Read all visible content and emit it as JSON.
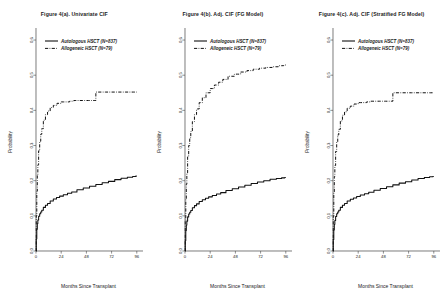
{
  "figure": {
    "background": "#ffffff",
    "axis_color": "#444444",
    "curve_color": "#111111"
  },
  "panels": [
    {
      "id": "panel-a",
      "title": "Figure 4(a). Univariate CIF",
      "xlabel": "Months Since Transplant",
      "ylabel": "Probability",
      "legend": [
        {
          "label": "Autologous HSCT (N=837)",
          "style": "solid"
        },
        {
          "label": "Allogeneic HSCT (N=79)",
          "style": "dashdot"
        }
      ],
      "xticks": [
        "0",
        "24",
        "48",
        "72",
        "96"
      ],
      "yticks": [
        "0.0",
        "0.1",
        "0.2",
        "0.3",
        "0.4",
        "0.5",
        "0.6"
      ]
    },
    {
      "id": "panel-b",
      "title": "Figure 4(b). Adj. CIF (FG Model)",
      "xlabel": "Months Since Transplant",
      "ylabel": "Probability",
      "legend": [
        {
          "label": "Autologous HSCT (N=837)",
          "style": "solid"
        },
        {
          "label": "Allogeneic HSCT (N=79)",
          "style": "dashdot"
        }
      ],
      "xticks": [
        "0",
        "24",
        "48",
        "72",
        "96"
      ],
      "yticks": [
        "0.0",
        "0.1",
        "0.2",
        "0.3",
        "0.4",
        "0.5",
        "0.6"
      ]
    },
    {
      "id": "panel-c",
      "title": "Figure 4(c). Adj. CIF (Stratified FG Model)",
      "xlabel": "Months Since Transplant",
      "ylabel": "Probability",
      "legend": [
        {
          "label": "Autologous HSCT (N=837)",
          "style": "solid"
        },
        {
          "label": "Allogeneic HSCT (N=79)",
          "style": "dashdot"
        }
      ],
      "xticks": [
        "0",
        "24",
        "48",
        "72",
        "96"
      ],
      "yticks": [
        "0.0",
        "0.1",
        "0.2",
        "0.3",
        "0.4",
        "0.5",
        "0.6"
      ]
    }
  ],
  "chart_data": [
    {
      "type": "line",
      "title": "Figure 4(a). Univariate CIF",
      "xlabel": "Months Since Transplant",
      "ylabel": "Probability",
      "xlim": [
        0,
        100
      ],
      "ylim": [
        0.0,
        0.62
      ],
      "grid": false,
      "legend_position": "top-left",
      "series": [
        {
          "name": "Autologous HSCT (N=837)",
          "style": "solid",
          "x": [
            0,
            0.5,
            1,
            1.5,
            2,
            3,
            4,
            5,
            6,
            8,
            10,
            12,
            15,
            18,
            21,
            24,
            28,
            32,
            36,
            42,
            48,
            54,
            60,
            66,
            72,
            78,
            84,
            90,
            94,
            96
          ],
          "y": [
            0.0,
            0.035,
            0.062,
            0.078,
            0.088,
            0.099,
            0.106,
            0.111,
            0.116,
            0.124,
            0.13,
            0.135,
            0.142,
            0.148,
            0.152,
            0.156,
            0.16,
            0.164,
            0.168,
            0.174,
            0.179,
            0.184,
            0.189,
            0.194,
            0.198,
            0.203,
            0.207,
            0.21,
            0.212,
            0.213
          ]
        },
        {
          "name": "Allogeneic HSCT (N=79)",
          "style": "dashdot",
          "x": [
            0,
            0.5,
            1,
            1.5,
            2,
            3,
            4,
            5,
            6,
            8,
            10,
            12,
            15,
            18,
            22,
            26,
            30,
            34,
            38,
            44,
            50,
            56,
            58,
            62,
            70,
            80,
            90,
            96
          ],
          "y": [
            0.0,
            0.1,
            0.17,
            0.215,
            0.245,
            0.285,
            0.312,
            0.332,
            0.348,
            0.372,
            0.388,
            0.398,
            0.408,
            0.414,
            0.42,
            0.424,
            0.424,
            0.426,
            0.428,
            0.428,
            0.428,
            0.428,
            0.452,
            0.452,
            0.452,
            0.452,
            0.452,
            0.452
          ]
        }
      ]
    },
    {
      "type": "line",
      "title": "Figure 4(b). Adj. CIF (FG Model)",
      "xlabel": "Months Since Transplant",
      "ylabel": "Probability",
      "xlim": [
        0,
        100
      ],
      "ylim": [
        0.0,
        0.62
      ],
      "grid": false,
      "legend_position": "top-left",
      "series": [
        {
          "name": "Autologous HSCT (N=837)",
          "style": "solid",
          "x": [
            0,
            0.5,
            1,
            1.5,
            2,
            3,
            4,
            5,
            6,
            8,
            10,
            12,
            15,
            18,
            21,
            24,
            28,
            32,
            36,
            42,
            48,
            54,
            60,
            66,
            72,
            78,
            84,
            90,
            94,
            96
          ],
          "y": [
            0.0,
            0.03,
            0.058,
            0.074,
            0.085,
            0.097,
            0.105,
            0.11,
            0.115,
            0.123,
            0.129,
            0.134,
            0.141,
            0.146,
            0.15,
            0.154,
            0.158,
            0.162,
            0.166,
            0.172,
            0.177,
            0.182,
            0.187,
            0.192,
            0.196,
            0.2,
            0.204,
            0.206,
            0.208,
            0.209
          ]
        },
        {
          "name": "Allogeneic HSCT (N=79)",
          "style": "dashdot",
          "x": [
            0,
            0.5,
            1,
            1.5,
            2,
            3,
            4,
            5,
            6,
            8,
            10,
            12,
            15,
            18,
            22,
            26,
            30,
            34,
            38,
            44,
            50,
            56,
            62,
            68,
            74,
            80,
            86,
            92,
            96
          ],
          "y": [
            0.0,
            0.085,
            0.148,
            0.19,
            0.222,
            0.268,
            0.3,
            0.322,
            0.34,
            0.368,
            0.388,
            0.404,
            0.422,
            0.436,
            0.45,
            0.462,
            0.472,
            0.48,
            0.488,
            0.497,
            0.503,
            0.509,
            0.513,
            0.517,
            0.52,
            0.522,
            0.524,
            0.527,
            0.529
          ]
        }
      ]
    },
    {
      "type": "line",
      "title": "Figure 4(c). Adj. CIF (Stratified FG Model)",
      "xlabel": "Months Since Transplant",
      "ylabel": "Probability",
      "xlim": [
        0,
        100
      ],
      "ylim": [
        0.0,
        0.62
      ],
      "grid": false,
      "legend_position": "top-left",
      "series": [
        {
          "name": "Autologous HSCT (N=837)",
          "style": "solid",
          "x": [
            0,
            0.5,
            1,
            1.5,
            2,
            3,
            4,
            5,
            6,
            8,
            10,
            12,
            15,
            18,
            21,
            24,
            28,
            32,
            36,
            42,
            48,
            54,
            60,
            66,
            72,
            78,
            84,
            90,
            94,
            96
          ],
          "y": [
            0.0,
            0.033,
            0.06,
            0.076,
            0.087,
            0.098,
            0.106,
            0.111,
            0.116,
            0.124,
            0.13,
            0.135,
            0.142,
            0.147,
            0.151,
            0.155,
            0.159,
            0.163,
            0.167,
            0.173,
            0.178,
            0.183,
            0.188,
            0.193,
            0.197,
            0.202,
            0.206,
            0.209,
            0.211,
            0.212
          ]
        },
        {
          "name": "Allogeneic HSCT (N=79)",
          "style": "dashdot",
          "x": [
            0,
            0.5,
            1,
            1.5,
            2,
            3,
            4,
            5,
            6,
            8,
            10,
            12,
            15,
            18,
            22,
            26,
            30,
            34,
            38,
            44,
            50,
            56,
            58,
            62,
            70,
            80,
            90,
            96
          ],
          "y": [
            0.0,
            0.098,
            0.168,
            0.212,
            0.243,
            0.283,
            0.31,
            0.33,
            0.346,
            0.37,
            0.386,
            0.396,
            0.406,
            0.412,
            0.418,
            0.422,
            0.422,
            0.424,
            0.426,
            0.426,
            0.426,
            0.426,
            0.45,
            0.45,
            0.45,
            0.45,
            0.45,
            0.45
          ]
        }
      ]
    }
  ]
}
